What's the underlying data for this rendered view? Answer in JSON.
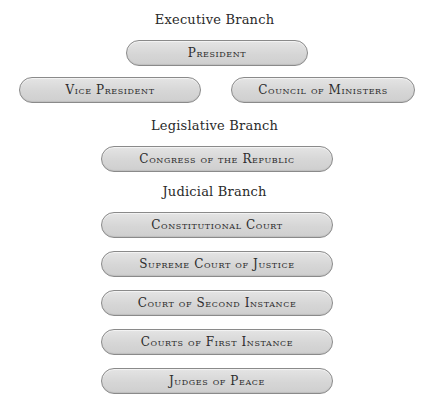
{
  "branches": {
    "executive": {
      "heading": "Executive Branch",
      "nodes": [
        "President",
        "Vice President",
        "Council of Ministers"
      ]
    },
    "legislative": {
      "heading": "Legislative Branch",
      "nodes": [
        "Congress of the Republic"
      ]
    },
    "judicial": {
      "heading": "Judicial Branch",
      "nodes": [
        "Constitutional Court",
        "Supreme Court of Justice",
        "Court of Second Instance",
        "Courts of First Instance",
        "Judges of Peace"
      ]
    }
  }
}
